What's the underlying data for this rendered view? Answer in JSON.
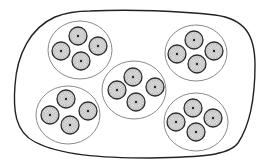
{
  "diagram": {
    "width": 267,
    "height": 164,
    "colors": {
      "background": "#ffffff",
      "outer_stroke": "#222222",
      "group_stroke": "#8a8a8a",
      "unit_stroke": "#2b2b2b",
      "unit_fill_center": "#ffffff",
      "unit_fill_edge": "#c8c8c8",
      "unit_ray": "#9a9a9a",
      "unit_core": "#222222"
    },
    "outer_boundary": {
      "path": "M 90 11 C 130 9, 180 11, 215 15 C 245 19, 255 35, 255 65 C 255 95, 250 125, 238 143 C 228 156, 200 157, 150 158 C 100 158, 60 155, 35 142 C 15 132, 13 110, 15 85 C 17 55, 30 28, 55 17 C 65 13, 78 11, 90 11 Z"
    },
    "groups": [
      {
        "name": "group-top-left",
        "cx": 80,
        "cy": 50,
        "rx": 32,
        "ry": 29,
        "units": [
          {
            "cx": 78,
            "cy": 36
          },
          {
            "cx": 61,
            "cy": 51
          },
          {
            "cx": 98,
            "cy": 46
          },
          {
            "cx": 81,
            "cy": 61
          }
        ]
      },
      {
        "name": "group-top-right",
        "cx": 196,
        "cy": 53,
        "rx": 31,
        "ry": 28,
        "units": [
          {
            "cx": 194,
            "cy": 40
          },
          {
            "cx": 177,
            "cy": 54
          },
          {
            "cx": 214,
            "cy": 51
          },
          {
            "cx": 197,
            "cy": 64
          }
        ]
      },
      {
        "name": "group-center",
        "cx": 134,
        "cy": 90,
        "rx": 32,
        "ry": 29,
        "units": [
          {
            "cx": 133,
            "cy": 77
          },
          {
            "cx": 117,
            "cy": 90
          },
          {
            "cx": 155,
            "cy": 87
          },
          {
            "cx": 136,
            "cy": 102
          }
        ]
      },
      {
        "name": "group-bottom-left",
        "cx": 68,
        "cy": 115,
        "rx": 32,
        "ry": 29,
        "units": [
          {
            "cx": 66,
            "cy": 99
          },
          {
            "cx": 50,
            "cy": 115
          },
          {
            "cx": 88,
            "cy": 111
          },
          {
            "cx": 70,
            "cy": 125
          }
        ]
      },
      {
        "name": "group-bottom-right",
        "cx": 196,
        "cy": 122,
        "rx": 32,
        "ry": 29,
        "units": [
          {
            "cx": 193,
            "cy": 108
          },
          {
            "cx": 176,
            "cy": 122
          },
          {
            "cx": 213,
            "cy": 118
          },
          {
            "cx": 196,
            "cy": 132
          }
        ]
      }
    ],
    "unit_radius": 9,
    "unit_rays": 16
  }
}
